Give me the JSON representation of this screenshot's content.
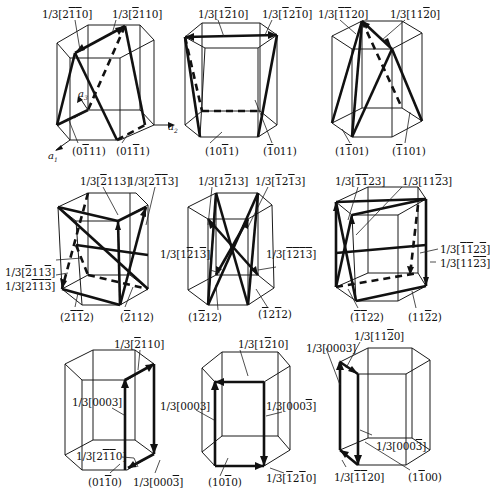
{
  "figure": {
    "axes": {
      "a1": "a1",
      "a2": "a2",
      "a3": "a3"
    },
    "panels": [
      {
        "id": "pyramidal-I-a",
        "vectors": [
          "1/3[2̄1̄1̄0]",
          "1/3[̄2110]"
        ],
        "planes": [
          "(01̄11)",
          "(011̄1)"
        ]
      },
      {
        "id": "pyramidal-I-b",
        "vectors": [
          "1/3[12̄ 10]",
          "1/3[̄12̄1 0]"
        ],
        "planes": [
          "(101̄1)",
          "(̄ 1011)"
        ]
      },
      {
        "id": "pyramidal-I-c",
        "vectors": [
          "1/3[̄1̄120]",
          "1/3[112̄0]"
        ],
        "planes": [
          "(11̄01)",
          "(̄1101)"
        ]
      },
      {
        "id": "pyramidal-II-a",
        "vectors": [
          "1/3[̄2113]",
          "1/3[21̄1̄3]",
          "1/3[̄211̄3̄]",
          "1/3[21̄1̄3̄]"
        ],
        "planes": [
          "(21̄1̄2)",
          "(̄2112)"
        ]
      },
      {
        "id": "pyramidal-II-b",
        "vectors": [
          "1/3[12̄13]",
          "1/3[̄12̄13]",
          "1/3[12̄13̄]",
          "1/3[̄12̄13̄]"
        ],
        "planes": [
          "(12̄12)",
          "(̄12̄12)"
        ]
      },
      {
        "id": "pyramidal-II-c",
        "vectors": [
          "1/3[̄1̄123]",
          "1/3[112̄3]",
          "1/3[̄1̄123̄]",
          "1/3[112̄3̄]"
        ],
        "planes": [
          "(̄1̄122)",
          "(112̄2)"
        ]
      },
      {
        "id": "prism-a",
        "vectors": [
          "1/3[̄2110]",
          "1/3[0003]",
          "1/3[21̄1̄0]",
          "1/3[0003̄]"
        ],
        "planes": [
          "(011̄0)"
        ]
      },
      {
        "id": "prism-b",
        "vectors": [
          "1/3[12̄10]",
          "1/3[0003]",
          "1/3[0003̄]",
          "1/3[̄12̄10]"
        ],
        "planes": [
          "(101̄0)"
        ]
      },
      {
        "id": "prism-c",
        "vectors": [
          "1/3[0003]",
          "1/3[112̄0]",
          "1/3[0003̄]",
          "1/3[̄1̄120]"
        ],
        "planes": [
          "(11̄00)"
        ]
      }
    ]
  },
  "labels": {
    "p1": {
      "v1": "1/3[2110]",
      "v2": "1/3[2110]",
      "pl1": "(0111)",
      "pl2": "(0111)"
    },
    "p2": {
      "v1": "1/3[1210]",
      "v2": "1/3[1210]",
      "pl1": "(1011)",
      "pl2": "(1011)"
    },
    "p3": {
      "v1": "1/3[1120]",
      "v2": "1/3[1120]",
      "pl1": "(1101)",
      "pl2": "(1101)"
    }
  }
}
